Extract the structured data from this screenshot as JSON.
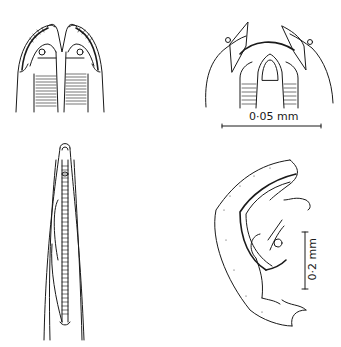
{
  "figure": {
    "panels": [
      {
        "id": "A",
        "position": "top-left",
        "subject": "cephalic end, lateral view with buccal capsule"
      },
      {
        "id": "B",
        "position": "top-right",
        "subject": "cephalic end with teeth/buccal capsule"
      },
      {
        "id": "C",
        "position": "bottom-left",
        "subject": "anterior end, oesophagus"
      },
      {
        "id": "D",
        "position": "bottom-right",
        "subject": "male posterior end with spicules"
      }
    ],
    "scale_bars": [
      {
        "label": "0·05 mm",
        "orientation": "horizontal",
        "panel": "top-right"
      },
      {
        "label": "0·2 mm",
        "orientation": "vertical",
        "panel": "bottom-right"
      }
    ]
  },
  "colors": {
    "ink": "#1a1a1a",
    "background": "#ffffff"
  }
}
